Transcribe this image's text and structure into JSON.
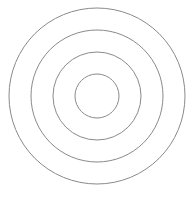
{
  "diagram": {
    "type": "concentric-circles",
    "center": [
      97,
      96
    ],
    "radii": [
      88,
      66,
      44,
      22
    ],
    "stroke_color": "#8a8a8a",
    "stroke_width": 1,
    "background": "#ffffff"
  },
  "caption": {
    "text": "",
    "note": "caption text partially clipped at bottom edge; illegible"
  }
}
